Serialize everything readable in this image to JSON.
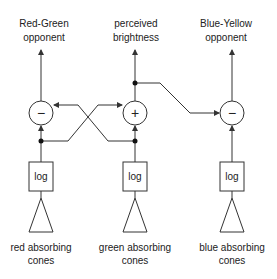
{
  "colors": {
    "stroke": "#333333",
    "text": "#222222",
    "background": "#ffffff"
  },
  "outputs": {
    "red_green": {
      "line1": "Red-Green",
      "line2": "opponent"
    },
    "brightness": {
      "line1": "perceived",
      "line2": "brightness"
    },
    "blue_yellow": {
      "line1": "Blue-Yellow",
      "line2": "opponent"
    }
  },
  "operators": {
    "red_green": "−",
    "brightness": "+",
    "blue_yellow": "−"
  },
  "log_boxes": {
    "red": "log",
    "green": "log",
    "blue": "log"
  },
  "inputs": {
    "red": {
      "line1": "red absorbing",
      "line2": "cones"
    },
    "green": {
      "line1": "green absorbing",
      "line2": "cones"
    },
    "blue": {
      "line1": "blue absorbing",
      "line2": "cones"
    }
  }
}
